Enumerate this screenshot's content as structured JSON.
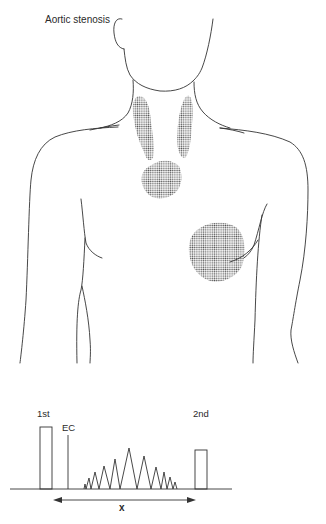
{
  "figure": {
    "title": "Aortic stenosis",
    "illustration": {
      "subject": "anterior torso outline (head, neck, shoulders, chest)",
      "shaded_regions": [
        {
          "name": "right-carotid-radiation",
          "description": "stippled elongated area along right side of neck"
        },
        {
          "name": "left-carotid-radiation",
          "description": "stippled elongated area along left side of neck"
        },
        {
          "name": "aortic-area",
          "description": "stippled area at upper sternum / suprasternal region"
        },
        {
          "name": "apex-area",
          "description": "stippled circular area at cardiac apex, left chest"
        }
      ],
      "colors": {
        "line": "#333333",
        "stipple": "#555555",
        "background": "#ffffff"
      }
    },
    "phonocardiogram": {
      "labels": {
        "first_sound": "1st",
        "ejection_click": "EC",
        "second_sound": "2nd",
        "interval": "x"
      },
      "murmur_shape": "crescendo-decrescendo (diamond-shaped) systolic ejection murmur"
    }
  }
}
